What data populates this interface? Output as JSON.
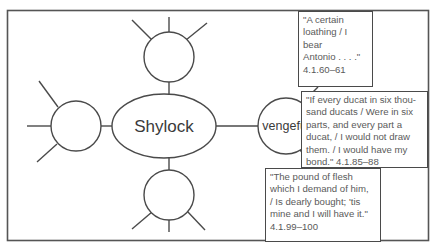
{
  "diagram": {
    "central_node": {
      "label": "Shylock"
    },
    "empty_nodes": [
      {
        "position": "top",
        "spokes": 3
      },
      {
        "position": "left",
        "spokes": 3
      },
      {
        "position": "bottom",
        "spokes": 3
      }
    ],
    "trait_node": {
      "label": "vengeful"
    },
    "evidence_boxes": [
      {
        "quote": "\"A certain\nloathing / I bear\nAntonio . . . .\"\n4.1.60–61"
      },
      {
        "quote": "\"If every ducat in six thou-\nsand ducats / Were in six\nparts, and every part a\nducat, / I would not draw\nthem. / I would have my\nbond.\" 4.1.85–88"
      },
      {
        "quote": "\"The pound of flesh\nwhich I demand of him,\n/ Is dearly bought; 'tis\nmine and I will have it.\"\n4.1.99–100"
      }
    ],
    "colors": {
      "stroke": "#4a4a4a",
      "text": "#3a3a3a",
      "quote_text": "#5a5a5a",
      "background": "#ffffff"
    }
  }
}
